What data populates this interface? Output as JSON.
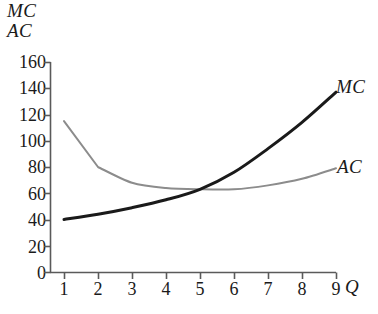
{
  "chart_data": {
    "type": "line",
    "title": "",
    "xlabel": "Q",
    "ylabel": "MC AC",
    "ylabel_lines": [
      "MC",
      "AC"
    ],
    "xlim": [
      0.55,
      9.9
    ],
    "ylim": [
      0,
      160
    ],
    "grid": false,
    "legend_position": "inline-right-of-curves",
    "xticks": [
      1,
      2,
      3,
      4,
      5,
      6,
      7,
      8,
      9
    ],
    "xtick_labels": [
      "1",
      "2",
      "3",
      "4",
      "5",
      "6",
      "7",
      "8",
      "9"
    ],
    "yticks": [
      0,
      20,
      40,
      60,
      80,
      100,
      120,
      140,
      160
    ],
    "ytick_labels": [
      "0",
      "20",
      "40",
      "60",
      "80",
      "100",
      "120",
      "140",
      "160"
    ],
    "x": [
      1,
      2,
      3,
      4,
      5,
      6,
      7,
      8,
      9
    ],
    "series": [
      {
        "name": "MC",
        "label": "MC",
        "color": "#1a1a1a",
        "width": 3.0,
        "values": [
          40,
          44,
          49,
          55,
          63,
          76,
          94,
          114,
          137
        ]
      },
      {
        "name": "AC",
        "label": "AC",
        "color": "#8c8c8c",
        "width": 2.0,
        "values": [
          115,
          80,
          68,
          64,
          63,
          63,
          66,
          71,
          79
        ]
      }
    ],
    "annotations": [
      {
        "text": "MC",
        "x": 9.4,
        "y": 143,
        "style": "italic"
      },
      {
        "text": "AC",
        "x": 9.4,
        "y": 84,
        "style": "italic"
      }
    ],
    "crossing_point": {
      "x": 5.4,
      "y": 62
    }
  },
  "axes": {
    "y_title_line1": "MC",
    "y_title_line2": "AC",
    "x_title": "Q"
  },
  "colors": {
    "background": "#ffffff",
    "axis": "#5a5a5a",
    "text": "#1a1a1a",
    "mc_curve": "#1a1a1a",
    "ac_curve": "#8c8c8c"
  }
}
